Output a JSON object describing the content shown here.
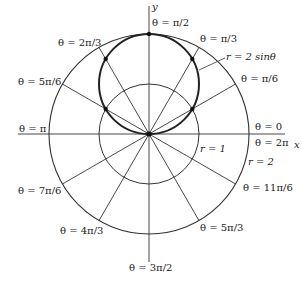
{
  "diagram": {
    "axes": {
      "x_label": "x",
      "y_label": "y"
    },
    "curve_label": "r = 2 sinθ",
    "circle_labels": {
      "inner": "r = 1",
      "outer": "r = 2"
    },
    "angle_labels": [
      {
        "id": "pi_over_2",
        "text": "θ = π/2"
      },
      {
        "id": "pi_over_3",
        "text": "θ = π/3"
      },
      {
        "id": "two_pi_over_3",
        "text": "θ = 2π/3"
      },
      {
        "id": "pi_over_6",
        "text": "θ = π/6"
      },
      {
        "id": "five_pi_over_6",
        "text": "θ = 5π/6"
      },
      {
        "id": "zero",
        "text": "θ = 0"
      },
      {
        "id": "two_pi",
        "text": "θ = 2π"
      },
      {
        "id": "pi",
        "text": "θ = π"
      },
      {
        "id": "seven_pi_over_6",
        "text": "θ = 7π/6"
      },
      {
        "id": "eleven_pi_over_6",
        "text": "θ = 11π/6"
      },
      {
        "id": "four_pi_over_3",
        "text": "θ = 4π/3"
      },
      {
        "id": "five_pi_over_3",
        "text": "θ = 5π/3"
      },
      {
        "id": "three_pi_over_2",
        "text": "θ = 3π/2"
      }
    ],
    "colors": {
      "line": "#333333",
      "curve": "#222222",
      "text": "#222222"
    }
  }
}
